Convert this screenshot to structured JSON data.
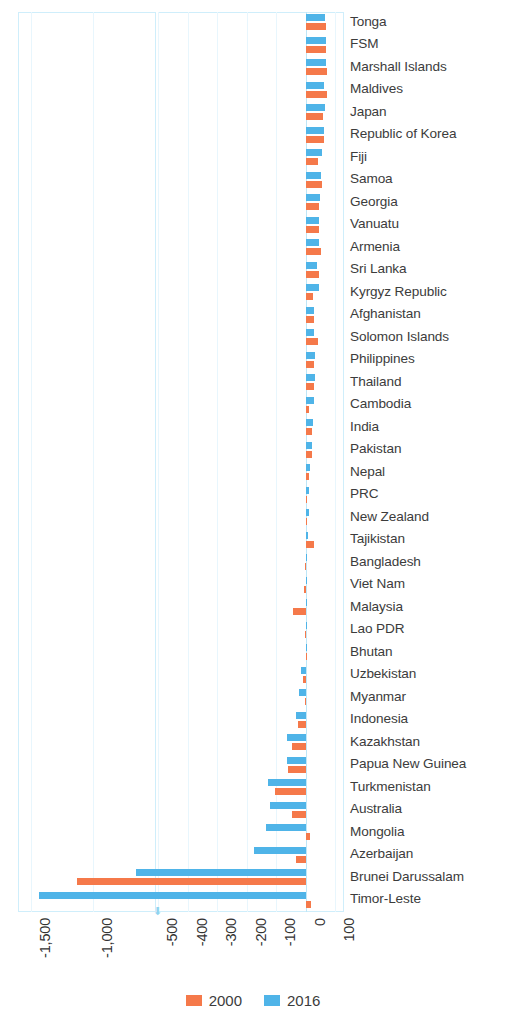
{
  "chart_data": {
    "type": "bar",
    "orientation": "horizontal",
    "title": "",
    "subtitle": "",
    "xlabel": "",
    "ylabel": "",
    "grid": true,
    "legend_position": "bottom",
    "axis_broken": true,
    "axis_break_note": "x-axis is broken between -1,000 and -500",
    "xtick_labels": [
      "-1,500",
      "-1,000",
      "-500",
      "-400",
      "-300",
      "-200",
      "-100",
      "0",
      "100"
    ],
    "xtick_values": [
      -1500,
      -1000,
      -500,
      -400,
      -300,
      -200,
      -100,
      0,
      100
    ],
    "xlim_left_panel": [
      -1600,
      -500
    ],
    "xlim_right_panel": [
      -500,
      130
    ],
    "colors": {
      "y2000": "#f5794a",
      "y2016": "#4fb4e8",
      "grid": "#cfeefb",
      "text": "#3c3c3c"
    },
    "categories": [
      "Tonga",
      "FSM",
      "Marshall Islands",
      "Maldives",
      "Japan",
      "Republic of Korea",
      "Fiji",
      "Samoa",
      "Georgia",
      "Vanuatu",
      "Armenia",
      "Sri Lanka",
      "Kyrgyz Republic",
      "Afghanistan",
      "Solomon Islands",
      "Philippines",
      "Thailand",
      "Cambodia",
      "India",
      "Pakistan",
      "Nepal",
      "PRC",
      "New Zealand",
      "Tajikistan",
      "Bangladesh",
      "Viet Nam",
      "Malaysia",
      "Lao PDR",
      "Bhutan",
      "Uzbekistan",
      "Myanmar",
      "Indonesia",
      "Kazakhstan",
      "Papua New Guinea",
      "Turkmenistan",
      "Australia",
      "Mongolia",
      "Azerbaijan",
      "Brunei Darussalam",
      "Timor-Leste"
    ],
    "series": [
      {
        "name": "2000",
        "color": "#f5794a",
        "values": [
          70,
          70,
          73,
          73,
          60,
          62,
          42,
          55,
          44,
          47,
          51,
          44,
          24,
          30,
          42,
          30,
          27,
          10,
          22,
          22,
          10,
          4,
          2,
          27,
          -2,
          -5,
          -44,
          -3,
          0,
          -8,
          -3,
          -25,
          -45,
          -58,
          -105,
          -46,
          14,
          -33,
          -1130,
          18
        ]
      },
      {
        "name": "2016",
        "color": "#4fb4e8",
        "values": [
          67,
          70,
          68,
          62,
          65,
          62,
          55,
          52,
          50,
          44,
          44,
          38,
          47,
          30,
          30,
          33,
          31,
          30,
          24,
          20,
          14,
          10,
          11,
          9,
          6,
          2,
          2,
          0,
          0,
          -14,
          -24,
          -32,
          -63,
          -64,
          -127,
          -122,
          -135,
          -175,
          -660,
          -1430
        ]
      }
    ]
  },
  "legend": {
    "items": [
      {
        "label": "2000",
        "color": "#f5794a"
      },
      {
        "label": "2016",
        "color": "#4fb4e8"
      }
    ]
  }
}
